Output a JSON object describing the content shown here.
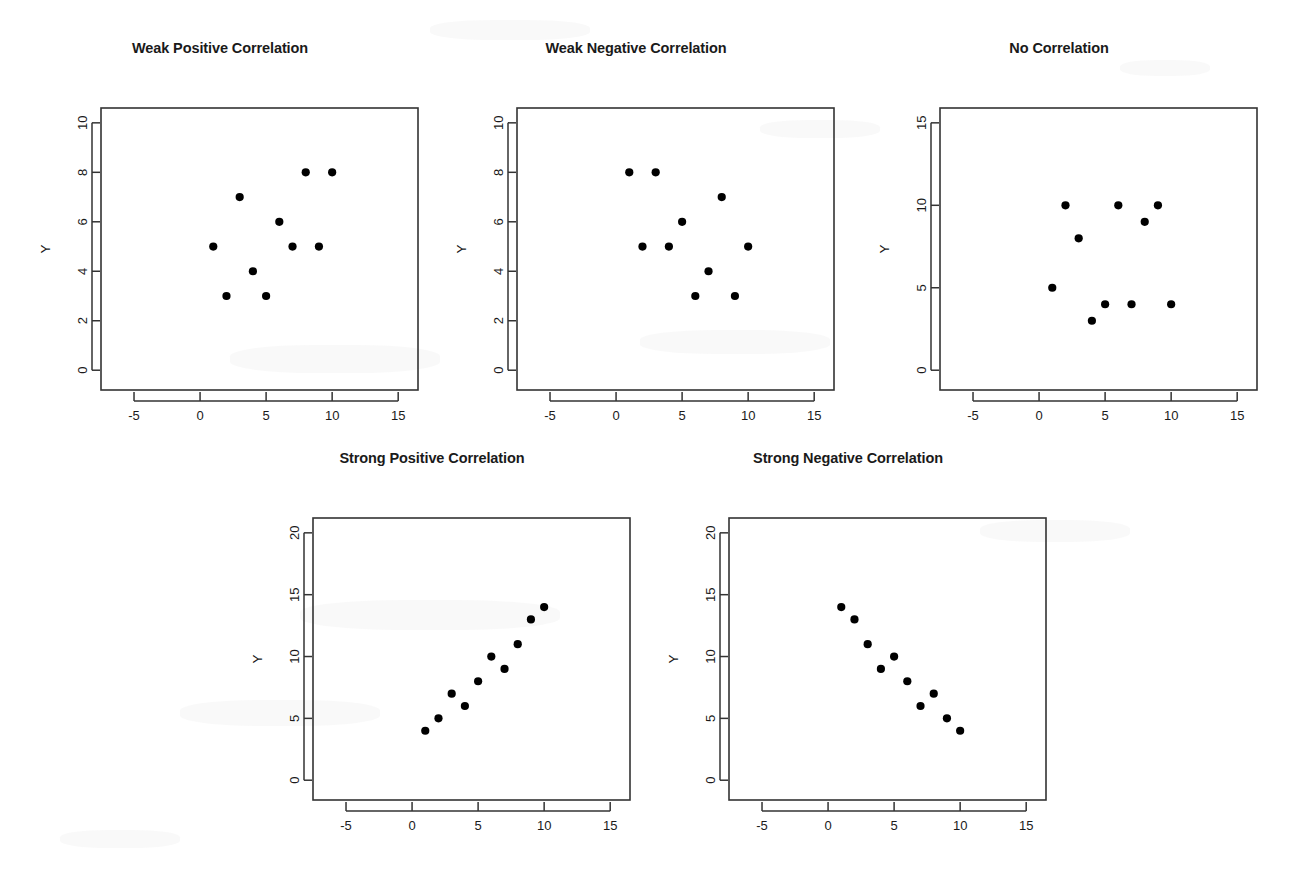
{
  "figure": {
    "background_color": "#ffffff",
    "foreground_color": "#000000",
    "point_color": "#000000",
    "axis_color": "#333333",
    "width": 1293,
    "height": 879
  },
  "chart_data": [
    {
      "type": "scatter",
      "title": "Weak Positive Correlation",
      "xlabel": "X",
      "ylabel": "Y",
      "xlim": [
        -7.5,
        16.5
      ],
      "ylim": [
        -0.8,
        10.6
      ],
      "xticks": [
        -5,
        0,
        5,
        10,
        15
      ],
      "yticks": [
        0,
        2,
        4,
        6,
        8,
        10
      ],
      "xticklabels": [
        "-5",
        "0",
        "5",
        "10",
        "15"
      ],
      "yticklabels": [
        "0",
        "2",
        "4",
        "6",
        "8",
        "10"
      ],
      "grid": false,
      "legend": "none",
      "x": [
        1,
        2,
        3,
        4,
        5,
        6,
        7,
        8,
        9,
        10
      ],
      "y": [
        5,
        3,
        7,
        4,
        3,
        6,
        5,
        8,
        5,
        8
      ],
      "points": [
        [
          1,
          5
        ],
        [
          2,
          3
        ],
        [
          3,
          7
        ],
        [
          4,
          4
        ],
        [
          5,
          3
        ],
        [
          6,
          6
        ],
        [
          7,
          5
        ],
        [
          8,
          8
        ],
        [
          9,
          5
        ],
        [
          10,
          8
        ]
      ]
    },
    {
      "type": "scatter",
      "title": "Weak Negative Correlation",
      "xlabel": "X",
      "ylabel": "Y",
      "xlim": [
        -7.5,
        16.5
      ],
      "ylim": [
        -0.8,
        10.6
      ],
      "xticks": [
        -5,
        0,
        5,
        10,
        15
      ],
      "yticks": [
        0,
        2,
        4,
        6,
        8,
        10
      ],
      "xticklabels": [
        "-5",
        "0",
        "5",
        "10",
        "15"
      ],
      "yticklabels": [
        "0",
        "2",
        "4",
        "6",
        "8",
        "10"
      ],
      "grid": false,
      "legend": "none",
      "x": [
        1,
        2,
        3,
        4,
        5,
        6,
        7,
        8,
        9,
        10
      ],
      "y": [
        8,
        5,
        8,
        5,
        6,
        3,
        4,
        7,
        3,
        5
      ],
      "points": [
        [
          1,
          8
        ],
        [
          2,
          5
        ],
        [
          3,
          8
        ],
        [
          4,
          5
        ],
        [
          5,
          6
        ],
        [
          6,
          3
        ],
        [
          7,
          4
        ],
        [
          8,
          7
        ],
        [
          9,
          3
        ],
        [
          10,
          5
        ]
      ]
    },
    {
      "type": "scatter",
      "title": "No Correlation",
      "xlabel": "X",
      "ylabel": "Y",
      "xlim": [
        -7.5,
        16.5
      ],
      "ylim": [
        -1.2,
        15.9
      ],
      "xticks": [
        -5,
        0,
        5,
        10,
        15
      ],
      "yticks": [
        0,
        5,
        10,
        15
      ],
      "xticklabels": [
        "-5",
        "0",
        "5",
        "10",
        "15"
      ],
      "yticklabels": [
        "0",
        "5",
        "10",
        "15"
      ],
      "grid": false,
      "legend": "none",
      "x": [
        1,
        2,
        3,
        4,
        5,
        6,
        7,
        8,
        9,
        10
      ],
      "y": [
        5,
        10,
        8,
        3,
        4,
        10,
        4,
        9,
        10,
        4
      ],
      "points": [
        [
          1,
          5
        ],
        [
          2,
          10
        ],
        [
          3,
          8
        ],
        [
          4,
          3
        ],
        [
          5,
          4
        ],
        [
          6,
          10
        ],
        [
          7,
          4
        ],
        [
          8,
          9
        ],
        [
          9,
          10
        ],
        [
          10,
          4
        ]
      ]
    },
    {
      "type": "scatter",
      "title": "Strong Positive Correlation",
      "xlabel": "X",
      "ylabel": "Y",
      "xlim": [
        -7.5,
        16.5
      ],
      "ylim": [
        -1.6,
        21.2
      ],
      "xticks": [
        -5,
        0,
        5,
        10,
        15
      ],
      "yticks": [
        0,
        5,
        10,
        15,
        20
      ],
      "xticklabels": [
        "-5",
        "0",
        "5",
        "10",
        "15"
      ],
      "yticklabels": [
        "0",
        "5",
        "10",
        "15",
        "20"
      ],
      "grid": false,
      "legend": "none",
      "x": [
        1,
        2,
        3,
        4,
        5,
        6,
        7,
        8,
        9,
        10
      ],
      "y": [
        4,
        5,
        7,
        6,
        8,
        10,
        9,
        11,
        13,
        14
      ],
      "points": [
        [
          1,
          4
        ],
        [
          2,
          5
        ],
        [
          3,
          7
        ],
        [
          4,
          6
        ],
        [
          5,
          8
        ],
        [
          6,
          10
        ],
        [
          7,
          9
        ],
        [
          8,
          11
        ],
        [
          9,
          13
        ],
        [
          10,
          14
        ]
      ]
    },
    {
      "type": "scatter",
      "title": "Strong Negative Correlation",
      "xlabel": "X",
      "ylabel": "Y",
      "xlim": [
        -7.5,
        16.5
      ],
      "ylim": [
        -1.6,
        21.2
      ],
      "xticks": [
        -5,
        0,
        5,
        10,
        15
      ],
      "yticks": [
        0,
        5,
        10,
        15,
        20
      ],
      "xticklabels": [
        "-5",
        "0",
        "5",
        "10",
        "15"
      ],
      "yticklabels": [
        "0",
        "5",
        "10",
        "15",
        "20"
      ],
      "grid": false,
      "legend": "none",
      "x": [
        1,
        2,
        3,
        4,
        5,
        6,
        7,
        8,
        9,
        10
      ],
      "y": [
        14,
        13,
        11,
        9,
        10,
        8,
        6,
        7,
        5,
        4
      ],
      "points": [
        [
          1,
          14
        ],
        [
          2,
          13
        ],
        [
          3,
          11
        ],
        [
          4,
          9
        ],
        [
          5,
          10
        ],
        [
          6,
          8
        ],
        [
          7,
          6
        ],
        [
          8,
          7
        ],
        [
          9,
          5
        ],
        [
          10,
          4
        ]
      ]
    }
  ],
  "layout": {
    "panels": [
      {
        "name": "weak-positive",
        "left": 0,
        "top": 28,
        "width": 440,
        "height": 405,
        "box": {
          "x": 101,
          "y": 80,
          "w": 317,
          "h": 282
        }
      },
      {
        "name": "weak-negative",
        "left": 416,
        "top": 28,
        "width": 440,
        "height": 405,
        "box": {
          "x": 101,
          "y": 80,
          "w": 317,
          "h": 282
        }
      },
      {
        "name": "no-correlation",
        "left": 839,
        "top": 28,
        "width": 440,
        "height": 405,
        "box": {
          "x": 101,
          "y": 80,
          "w": 317,
          "h": 282
        }
      },
      {
        "name": "strong-positive",
        "left": 212,
        "top": 438,
        "width": 440,
        "height": 405,
        "box": {
          "x": 101,
          "y": 80,
          "w": 317,
          "h": 282
        }
      },
      {
        "name": "strong-negative",
        "left": 628,
        "top": 438,
        "width": 440,
        "height": 405,
        "box": {
          "x": 101,
          "y": 80,
          "w": 317,
          "h": 282
        }
      }
    ]
  }
}
